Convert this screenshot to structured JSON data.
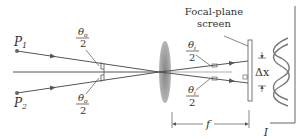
{
  "figure": {
    "points": [
      {
        "label": "P",
        "sub": "1"
      },
      {
        "label": "P",
        "sub": "2"
      }
    ],
    "angle_object": {
      "num": "θ",
      "sub": "o",
      "den": "2"
    },
    "angle_image": {
      "num": "θ",
      "sub": "i",
      "den": "2"
    },
    "screen_label_line1": "Focal-plane",
    "screen_label_line2": "screen",
    "separation_label": "Δx",
    "focal_label": "f",
    "intensity_label": "I"
  },
  "colors": {
    "ray": "#555555",
    "lens": "#8a8a8a",
    "ink": "#333333"
  }
}
